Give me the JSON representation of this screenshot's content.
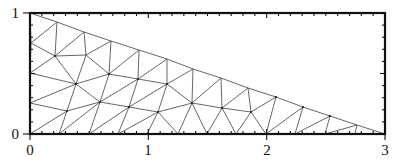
{
  "figure": {
    "domain_vertices": [
      [
        0,
        0
      ],
      [
        3,
        0
      ],
      [
        0,
        1
      ]
    ],
    "axes": {
      "x": {
        "min": 0,
        "max": 3,
        "major_ticks": [
          0,
          1,
          2,
          3
        ],
        "tick_labels": [
          "0",
          "1",
          "2",
          "3"
        ],
        "minor_step": 0.1
      },
      "y": {
        "min": 0,
        "max": 1,
        "major_ticks": [
          0,
          1
        ],
        "tick_labels": [
          "0",
          "1"
        ],
        "minor_step": 0.1
      }
    },
    "pixel_frame": {
      "left": 30,
      "right": 385,
      "top": 13,
      "bottom": 134
    },
    "colors": {
      "frame": "#111111",
      "mesh": "#555555",
      "background": "#ffffff"
    }
  },
  "mesh": {
    "nodes": [
      [
        30,
        13
      ],
      [
        57,
        22
      ],
      [
        84,
        32
      ],
      [
        111,
        41
      ],
      [
        139,
        50
      ],
      [
        167,
        59
      ],
      [
        193,
        69
      ],
      [
        221,
        78
      ],
      [
        248,
        88
      ],
      [
        276,
        97
      ],
      [
        303,
        107
      ],
      [
        330,
        116
      ],
      [
        357,
        125
      ],
      [
        385,
        134
      ],
      [
        31,
        43
      ],
      [
        30,
        73
      ],
      [
        30,
        103
      ],
      [
        30,
        134
      ],
      [
        59,
        134
      ],
      [
        89,
        134
      ],
      [
        118,
        134
      ],
      [
        147,
        134
      ],
      [
        178,
        134
      ],
      [
        207,
        134
      ],
      [
        236,
        134
      ],
      [
        266,
        134
      ],
      [
        295,
        134
      ],
      [
        325,
        134
      ],
      [
        355,
        134
      ],
      [
        55,
        56
      ],
      [
        86,
        55
      ],
      [
        76,
        84
      ],
      [
        109,
        74
      ],
      [
        138,
        79
      ],
      [
        167,
        84
      ],
      [
        192,
        103
      ],
      [
        222,
        108
      ],
      [
        251,
        112
      ],
      [
        100,
        102
      ],
      [
        67,
        111
      ],
      [
        129,
        107
      ],
      [
        158,
        112
      ]
    ],
    "edges": [
      [
        0,
        1
      ],
      [
        1,
        2
      ],
      [
        2,
        3
      ],
      [
        3,
        4
      ],
      [
        4,
        5
      ],
      [
        5,
        6
      ],
      [
        6,
        7
      ],
      [
        7,
        8
      ],
      [
        8,
        9
      ],
      [
        9,
        10
      ],
      [
        10,
        11
      ],
      [
        11,
        12
      ],
      [
        12,
        13
      ],
      [
        0,
        14
      ],
      [
        14,
        15
      ],
      [
        15,
        16
      ],
      [
        16,
        17
      ],
      [
        17,
        18
      ],
      [
        18,
        19
      ],
      [
        19,
        20
      ],
      [
        20,
        21
      ],
      [
        21,
        22
      ],
      [
        22,
        23
      ],
      [
        23,
        24
      ],
      [
        24,
        25
      ],
      [
        25,
        26
      ],
      [
        26,
        27
      ],
      [
        27,
        28
      ],
      [
        28,
        13
      ],
      [
        14,
        1
      ],
      [
        14,
        29
      ],
      [
        29,
        1
      ],
      [
        29,
        2
      ],
      [
        29,
        30
      ],
      [
        30,
        2
      ],
      [
        30,
        3
      ],
      [
        29,
        15
      ],
      [
        29,
        31
      ],
      [
        30,
        31
      ],
      [
        15,
        31
      ],
      [
        31,
        16
      ],
      [
        30,
        32
      ],
      [
        32,
        3
      ],
      [
        32,
        4
      ],
      [
        32,
        31
      ],
      [
        32,
        33
      ],
      [
        33,
        4
      ],
      [
        33,
        5
      ],
      [
        33,
        34
      ],
      [
        34,
        5
      ],
      [
        34,
        6
      ],
      [
        31,
        39
      ],
      [
        16,
        39
      ],
      [
        39,
        17
      ],
      [
        39,
        18
      ],
      [
        31,
        38
      ],
      [
        38,
        39
      ],
      [
        38,
        18
      ],
      [
        38,
        19
      ],
      [
        32,
        38
      ],
      [
        38,
        40
      ],
      [
        33,
        40
      ],
      [
        40,
        19
      ],
      [
        40,
        20
      ],
      [
        33,
        38
      ],
      [
        34,
        40
      ],
      [
        34,
        41
      ],
      [
        40,
        41
      ],
      [
        41,
        20
      ],
      [
        41,
        21
      ],
      [
        34,
        35
      ],
      [
        35,
        6
      ],
      [
        35,
        7
      ],
      [
        35,
        41
      ],
      [
        41,
        22
      ],
      [
        35,
        22
      ],
      [
        35,
        23
      ],
      [
        35,
        36
      ],
      [
        36,
        7
      ],
      [
        36,
        8
      ],
      [
        36,
        23
      ],
      [
        36,
        24
      ],
      [
        36,
        37
      ],
      [
        37,
        8
      ],
      [
        37,
        9
      ],
      [
        37,
        24
      ],
      [
        37,
        25
      ],
      [
        9,
        25
      ],
      [
        25,
        10
      ],
      [
        10,
        26
      ],
      [
        26,
        11
      ],
      [
        11,
        27
      ],
      [
        27,
        12
      ],
      [
        12,
        28
      ]
    ],
    "dots": [
      29,
      31,
      32,
      38,
      40,
      35,
      36,
      37,
      39,
      41,
      33,
      34,
      9,
      10,
      11
    ]
  }
}
